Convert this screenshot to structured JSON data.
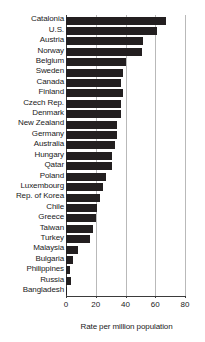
{
  "chart_data": {
    "type": "bar",
    "orientation": "horizontal",
    "title": "",
    "xlabel": "Rate per million population",
    "ylabel": "",
    "xlim": [
      0,
      80
    ],
    "xticks": [
      0,
      20,
      40,
      60,
      80
    ],
    "grid": true,
    "legend": null,
    "categories": [
      "Catalonia",
      "U.S.",
      "Austria",
      "Norway",
      "Belgium",
      "Sweden",
      "Canada",
      "Finland",
      "Czech Rep.",
      "Denmark",
      "New Zealand",
      "Germany",
      "Australia",
      "Hungary",
      "Qatar",
      "Poland",
      "Luxembourg",
      "Rep. of Korea",
      "Chile",
      "Greece",
      "Taiwan",
      "Turkey",
      "Malaysia",
      "Bulgaria",
      "Philippines",
      "Russia",
      "Bangladesh"
    ],
    "values": [
      67,
      61,
      52,
      51,
      40,
      38,
      37,
      38,
      37,
      37,
      34,
      34,
      33,
      31,
      31,
      27,
      25,
      23,
      21,
      20,
      18,
      16,
      8,
      5,
      3,
      3.5,
      0.3
    ],
    "bar_color": "#231f20"
  }
}
